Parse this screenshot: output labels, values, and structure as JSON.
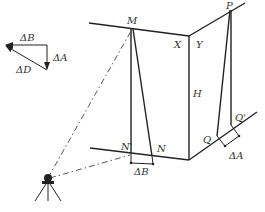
{
  "diagram": {
    "type": "surveying-geometry",
    "labels": {
      "M": "M",
      "N": "N",
      "N_prime": "N'",
      "P": "P",
      "Q": "Q",
      "Q_prime": "Q'",
      "X": "X",
      "Y": "Y",
      "H": "H",
      "delta_B_bottom": "ΔB",
      "delta_A_bottom": "ΔA"
    },
    "vector_triangle": {
      "delta_B": "ΔB",
      "delta_A": "ΔA",
      "delta_D": "ΔD"
    },
    "instrument": "total-station-on-tripod"
  }
}
